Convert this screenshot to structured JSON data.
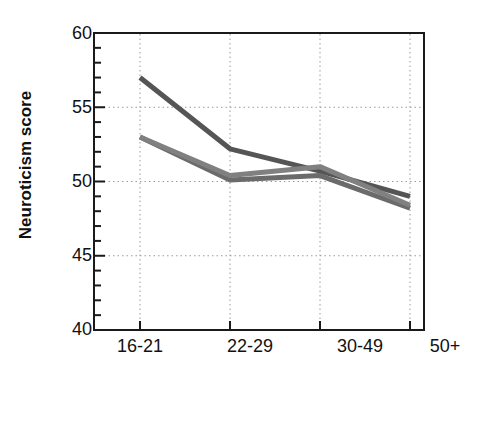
{
  "chart_data": {
    "type": "line",
    "title": "",
    "xlabel": "Age (years)",
    "ylabel": "Neuroticism score",
    "categories": [
      "16-21",
      "22-29",
      "30-49",
      "50+"
    ],
    "ylim": [
      40,
      60
    ],
    "yticks": [
      40,
      45,
      50,
      55,
      60
    ],
    "ytick_labels": [
      "40",
      "45",
      "50",
      "55",
      "60"
    ],
    "minor_tick_step": 1,
    "grid": true,
    "grid_style": "dotted",
    "legend": "none",
    "series": [
      {
        "name": "series-1",
        "color": "#555555",
        "values": [
          57.0,
          52.2,
          50.7,
          49.0
        ]
      },
      {
        "name": "series-2",
        "color": "#6b6b6b",
        "values": [
          53.0,
          50.1,
          50.4,
          48.2
        ]
      },
      {
        "name": "series-3",
        "color": "#808080",
        "values": [
          53.0,
          50.4,
          51.0,
          48.4
        ]
      }
    ]
  },
  "axis": {
    "y_title": "Neuroticism score",
    "x_title": "Age (years)",
    "y_tick_0": "40",
    "y_tick_1": "45",
    "y_tick_2": "50",
    "y_tick_3": "55",
    "y_tick_4": "60",
    "x_tick_0": "16-21",
    "x_tick_1": "22-29",
    "x_tick_2": "30-49",
    "x_tick_3": "50+"
  }
}
